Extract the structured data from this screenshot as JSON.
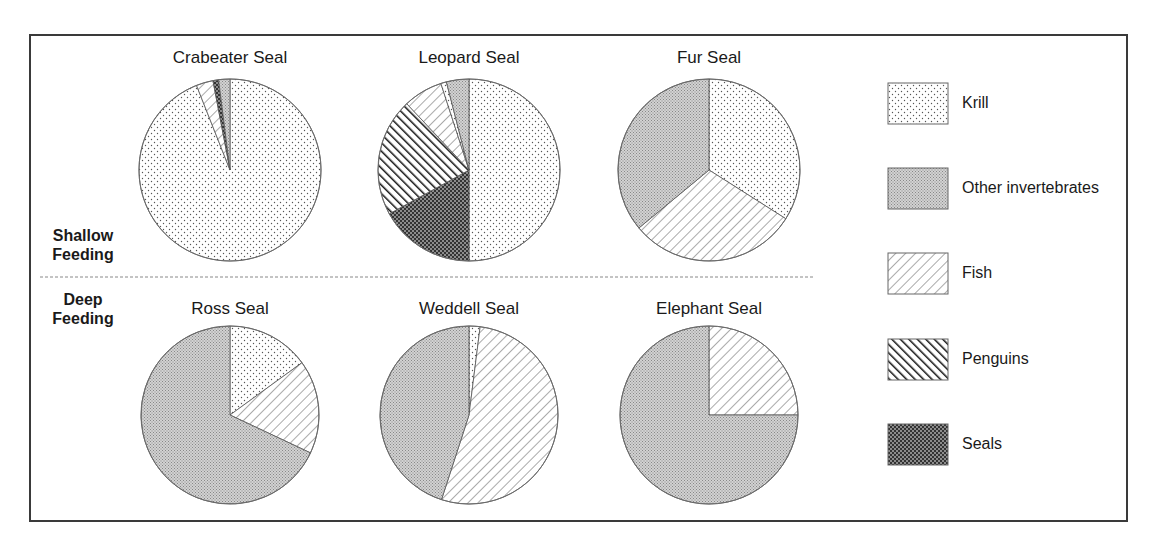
{
  "chart_data": {
    "type": "pie",
    "layout": "2x3 grid of pies with legend at right",
    "row_labels": [
      {
        "id": "shallow",
        "line1": "Shallow",
        "line2": "Feeding"
      },
      {
        "id": "deep",
        "line1": "Deep",
        "line2": "Feeding"
      }
    ],
    "categories": [
      "Krill",
      "Other invertebrates",
      "Fish",
      "Penguins",
      "Seals"
    ],
    "legend": [
      {
        "label": "Krill",
        "pattern": "krill"
      },
      {
        "label": "Other invertebrates",
        "pattern": "other"
      },
      {
        "label": "Fish",
        "pattern": "fish"
      },
      {
        "label": "Penguins",
        "pattern": "penguins"
      },
      {
        "label": "Seals",
        "pattern": "seals"
      }
    ],
    "legend_position": "right",
    "pies": [
      {
        "title": "Crabeater Seal",
        "row": "shallow",
        "slices": [
          {
            "category": "Krill",
            "value": 94
          },
          {
            "category": "Fish",
            "value": 3
          },
          {
            "category": "Seals",
            "value": 1
          },
          {
            "category": "Other invertebrates",
            "value": 2
          }
        ]
      },
      {
        "title": "Leopard Seal",
        "row": "shallow",
        "slices": [
          {
            "category": "Krill",
            "value": 50
          },
          {
            "category": "Seals",
            "value": 17
          },
          {
            "category": "Penguins",
            "value": 21
          },
          {
            "category": "Fish",
            "value": 7
          },
          {
            "category": "Krill",
            "value": 1
          },
          {
            "category": "Other invertebrates",
            "value": 4
          }
        ]
      },
      {
        "title": "Fur Seal",
        "row": "shallow",
        "slices": [
          {
            "category": "Krill",
            "value": 34
          },
          {
            "category": "Fish",
            "value": 30
          },
          {
            "category": "Other invertebrates",
            "value": 36
          }
        ]
      },
      {
        "title": "Ross Seal",
        "row": "deep",
        "slices": [
          {
            "category": "Krill",
            "value": 15
          },
          {
            "category": "Fish",
            "value": 17
          },
          {
            "category": "Other invertebrates",
            "value": 68
          }
        ]
      },
      {
        "title": "Weddell Seal",
        "row": "deep",
        "slices": [
          {
            "category": "Krill",
            "value": 2
          },
          {
            "category": "Fish",
            "value": 53
          },
          {
            "category": "Other invertebrates",
            "value": 45
          }
        ]
      },
      {
        "title": "Elephant Seal",
        "row": "deep",
        "slices": [
          {
            "category": "Fish",
            "value": 25
          },
          {
            "category": "Other invertebrates",
            "value": 75
          }
        ]
      }
    ],
    "units": "percent of diet"
  },
  "geometry": {
    "pies": [
      {
        "cx": 230,
        "cy": 170,
        "r": 91
      },
      {
        "cx": 469,
        "cy": 170,
        "r": 91
      },
      {
        "cx": 709,
        "cy": 170,
        "r": 91
      },
      {
        "cx": 230,
        "cy": 415,
        "r": 89
      },
      {
        "cx": 469,
        "cy": 415,
        "r": 89
      },
      {
        "cx": 709,
        "cy": 415,
        "r": 89
      }
    ],
    "titles_y": [
      48,
      48,
      48,
      299,
      299,
      299
    ],
    "legend_swatches": [
      {
        "x": 888,
        "y": 83,
        "w": 60,
        "h": 41
      },
      {
        "x": 888,
        "y": 168,
        "w": 60,
        "h": 41
      },
      {
        "x": 888,
        "y": 253,
        "w": 60,
        "h": 41
      },
      {
        "x": 888,
        "y": 339,
        "w": 60,
        "h": 41
      },
      {
        "x": 888,
        "y": 424,
        "w": 60,
        "h": 41
      }
    ],
    "legend_label_y": [
      94,
      179,
      264,
      350,
      435
    ],
    "divider": {
      "x1": 40,
      "x2": 815,
      "y": 277
    }
  },
  "colors": {
    "frame": "#3a3a3a",
    "outline": "#6a6a6a",
    "ink": "#1a1a1a"
  }
}
